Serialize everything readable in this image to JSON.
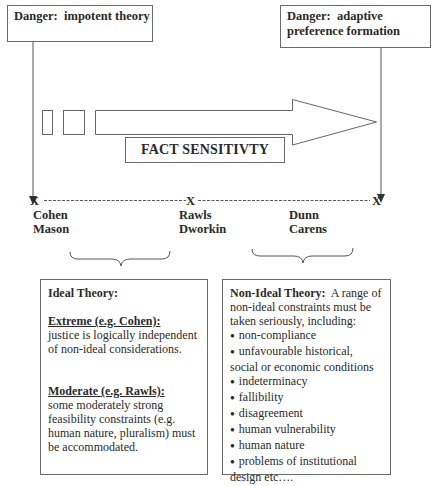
{
  "danger_left": {
    "label": "Danger:",
    "text": "impotent theory"
  },
  "danger_right": {
    "label": "Danger:",
    "text": "adaptive preference formation"
  },
  "arrow": {
    "label": "FACT SENSITIVTY"
  },
  "axis": {
    "marker": "X",
    "points": [
      {
        "marker": "X",
        "names": [
          "Cohen",
          "Mason"
        ]
      },
      {
        "marker": "X",
        "names": [
          "Rawls",
          "Dworkin"
        ]
      },
      {
        "marker": "X",
        "names": []
      }
    ],
    "extra_labels": [
      "Dunn",
      "Carens"
    ]
  },
  "ideal_panel": {
    "heading": "Ideal Theory:",
    "extreme_title": "Extreme (e.g. Cohen):",
    "extreme_text": "justice is logically independent of non-ideal considerations.",
    "moderate_title": "Moderate (e.g. Rawls):",
    "moderate_text": "some moderately strong feasibility constraints (e.g. human nature, pluralism) must be accommodated."
  },
  "nonideal_panel": {
    "heading": "Non-Ideal Theory:",
    "intro": "A range of non-ideal constraints must be taken seriously, including:",
    "items": [
      "non-compliance",
      "unfavourable historical, social or economic conditions",
      "indeterminacy",
      "fallibility",
      "disagreement",
      "human vulnerability",
      "human nature",
      "problems of institutional design etc…."
    ]
  },
  "colors": {
    "line": "#555555",
    "text": "#2a2a2a",
    "border": "#6a6a6a"
  }
}
